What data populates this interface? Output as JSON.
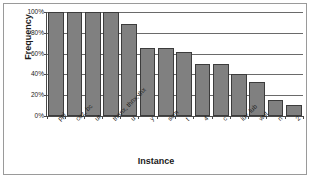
{
  "chart_data": {
    "type": "bar",
    "title": "",
    "xlabel": "Instance",
    "ylabel": "Frequency",
    "ylim": [
      0,
      100
    ],
    "grid": true,
    "legend": "none",
    "categories": [
      "ppl",
      "cuz, bc",
      "ur",
      "thanx, thnx, thx",
      "u",
      "y",
      "sum",
      "t",
      "4",
      "c",
      "luv, lub",
      "wut",
      "n",
      "2"
    ],
    "values": [
      100,
      100,
      100,
      100,
      88,
      65,
      65,
      62,
      50,
      50,
      40,
      33,
      15,
      11
    ],
    "y_ticks": [
      0,
      20,
      40,
      60,
      80,
      100
    ],
    "y_tick_labels": [
      "0%",
      "20%",
      "40%",
      "60%",
      "80%",
      "100%"
    ],
    "bar_color": "#808080",
    "bar_border_color": "#3c3c3c",
    "gridline_color": "#6a6a6a",
    "axis_color": "#4a4a4a",
    "frame_color": "#9a9a9a",
    "background": "#ffffff"
  }
}
